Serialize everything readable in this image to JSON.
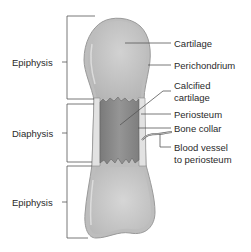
{
  "figure": {
    "left_labels": {
      "top_epiphysis": "Epiphysis",
      "diaphysis": "Diaphysis",
      "bottom_epiphysis": "Epiphysis"
    },
    "right_labels": {
      "cartilage": "Cartilage",
      "perichondrium": "Perichondrium",
      "calcified_cartilage_line1": "Calcified",
      "calcified_cartilage_line2": "cartilage",
      "periosteum": "Periosteum",
      "bone_collar": "Bone collar",
      "blood_vessel_line1": "Blood vessel",
      "blood_vessel_line2": "to periosteum"
    },
    "colors": {
      "cartilage": "#c9c9c9",
      "cartilage_highlight": "#dcdcdc",
      "calcified_cartilage": "#8e8e8e",
      "perichondrium": "#b5b5b5",
      "bone_collar": "#e6e6e6",
      "lines": "#555555",
      "text": "#2a2a2a"
    }
  }
}
